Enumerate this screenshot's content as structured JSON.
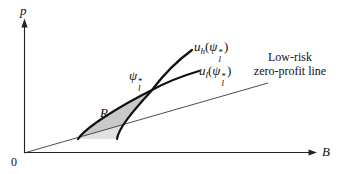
{
  "figure": {
    "axes": {
      "y_label": "p",
      "x_label": "B",
      "origin": "0"
    },
    "labels": {
      "uh": {
        "base": "u",
        "base_sub": "h",
        "open": "(",
        "arg": "ψ",
        "arg_sup": "*",
        "arg_sub": "l",
        "close": ")"
      },
      "ul": {
        "base": "u",
        "base_sub": "l",
        "open": "(",
        "arg": "ψ",
        "arg_sup": "*",
        "arg_sub": "l",
        "close": ")"
      },
      "contract": {
        "base": "ψ",
        "sup": "*",
        "sub": "l"
      },
      "region": "R",
      "zero_profit_line1": "Low-risk",
      "zero_profit_line2": "zero-profit line"
    },
    "colors": {
      "curve": "#111111",
      "axis": "#222222",
      "thin_line": "#3a3a3a",
      "region_upper": "#c9c9c9",
      "region_lower": "#e0e0e0"
    }
  }
}
